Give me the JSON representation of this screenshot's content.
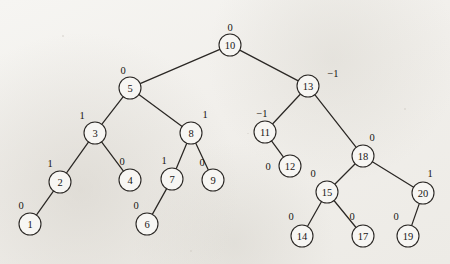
{
  "figure": {
    "kind": "avl-binary-search-tree",
    "node_radius": 11,
    "colors": {
      "background": "#f1efeb",
      "stroke": "#2a2724",
      "node_fill": "#f7f6f3",
      "text": "#171513"
    }
  },
  "nodes": [
    {
      "id": "n10",
      "key": "10",
      "balance": "0",
      "x": 230,
      "y": 45,
      "bx": 230,
      "by": 27
    },
    {
      "id": "n5",
      "key": "5",
      "balance": "0",
      "x": 130,
      "y": 88,
      "bx": 123,
      "by": 70
    },
    {
      "id": "n13",
      "key": "13",
      "balance": "−1",
      "x": 308,
      "y": 86,
      "bx": 333,
      "by": 73
    },
    {
      "id": "n3",
      "key": "3",
      "balance": "1",
      "x": 95,
      "y": 133,
      "bx": 82,
      "by": 115
    },
    {
      "id": "n8",
      "key": "8",
      "balance": "1",
      "x": 191,
      "y": 133,
      "bx": 205,
      "by": 114
    },
    {
      "id": "n11",
      "key": "11",
      "balance": "−1",
      "x": 265,
      "y": 132,
      "bx": 262,
      "by": 113
    },
    {
      "id": "n18",
      "key": "18",
      "balance": "0",
      "x": 363,
      "y": 156,
      "bx": 372,
      "by": 137
    },
    {
      "id": "n2",
      "key": "2",
      "balance": "1",
      "x": 60,
      "y": 182,
      "bx": 50,
      "by": 163
    },
    {
      "id": "n4",
      "key": "4",
      "balance": "0",
      "x": 130,
      "y": 180,
      "bx": 122,
      "by": 161
    },
    {
      "id": "n7",
      "key": "7",
      "balance": "1",
      "x": 172,
      "y": 179,
      "bx": 164,
      "by": 160
    },
    {
      "id": "n9",
      "key": "9",
      "balance": "0",
      "x": 213,
      "y": 180,
      "bx": 202,
      "by": 162
    },
    {
      "id": "n12",
      "key": "12",
      "balance": "0",
      "x": 290,
      "y": 166,
      "bx": 268,
      "by": 166
    },
    {
      "id": "n15",
      "key": "15",
      "balance": "0",
      "x": 327,
      "y": 192,
      "bx": 313,
      "by": 173
    },
    {
      "id": "n20",
      "key": "20",
      "balance": "1",
      "x": 423,
      "y": 193,
      "bx": 430,
      "by": 173
    },
    {
      "id": "n1",
      "key": "1",
      "balance": "0",
      "x": 30,
      "y": 224,
      "bx": 21,
      "by": 205
    },
    {
      "id": "n6",
      "key": "6",
      "balance": "0",
      "x": 147,
      "y": 224,
      "bx": 136,
      "by": 205
    },
    {
      "id": "n14",
      "key": "14",
      "balance": "0",
      "x": 302,
      "y": 236,
      "bx": 291,
      "by": 216
    },
    {
      "id": "n17",
      "key": "17",
      "balance": "0",
      "x": 363,
      "y": 236,
      "bx": 352,
      "by": 216
    },
    {
      "id": "n19",
      "key": "19",
      "balance": "0",
      "x": 408,
      "y": 236,
      "bx": 396,
      "by": 216
    }
  ],
  "edges": [
    {
      "from": "n10",
      "to": "n5"
    },
    {
      "from": "n10",
      "to": "n13"
    },
    {
      "from": "n5",
      "to": "n3"
    },
    {
      "from": "n5",
      "to": "n8"
    },
    {
      "from": "n3",
      "to": "n2"
    },
    {
      "from": "n3",
      "to": "n4"
    },
    {
      "from": "n2",
      "to": "n1"
    },
    {
      "from": "n8",
      "to": "n7"
    },
    {
      "from": "n8",
      "to": "n9"
    },
    {
      "from": "n7",
      "to": "n6"
    },
    {
      "from": "n13",
      "to": "n11"
    },
    {
      "from": "n13",
      "to": "n18"
    },
    {
      "from": "n11",
      "to": "n12"
    },
    {
      "from": "n18",
      "to": "n15"
    },
    {
      "from": "n18",
      "to": "n20"
    },
    {
      "from": "n15",
      "to": "n14"
    },
    {
      "from": "n15",
      "to": "n17"
    },
    {
      "from": "n20",
      "to": "n19"
    }
  ]
}
